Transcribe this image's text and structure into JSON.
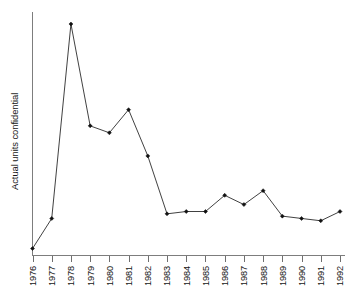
{
  "chart_data": {
    "type": "line",
    "title": "",
    "subtitle": "",
    "xlabel": "",
    "ylabel": "Actual units confidential",
    "categories": [
      "1976",
      "1977",
      "1978",
      "1979",
      "1980",
      "1981",
      "1982",
      "1983",
      "1984",
      "1985",
      "1986",
      "1987",
      "1988",
      "1989",
      "1990",
      "1991",
      "1992"
    ],
    "values": [
      3,
      16,
      100,
      56,
      53,
      63,
      43,
      18,
      19,
      19,
      26,
      22,
      28,
      17,
      16,
      15,
      19
    ],
    "series": [
      {
        "name": "Actual units confidential",
        "values": [
          3,
          16,
          100,
          56,
          53,
          63,
          43,
          18,
          19,
          19,
          26,
          22,
          28,
          17,
          16,
          15,
          19
        ]
      }
    ],
    "ylim": [
      0,
      105
    ],
    "y_axis_ticks_shown": false,
    "y_axis_tick_labels": [],
    "grid": false,
    "legend": false,
    "legend_position": "none",
    "marker": "diamond",
    "line_color": "#2b2b2b",
    "marker_color": "#111111",
    "axis_color": "#7d7d7d",
    "background_color": "#ffffff",
    "annotations": [],
    "x_tick_label_rotation": -90
  },
  "axes": {
    "y_title": "Actual units confidential",
    "x_title": ""
  }
}
